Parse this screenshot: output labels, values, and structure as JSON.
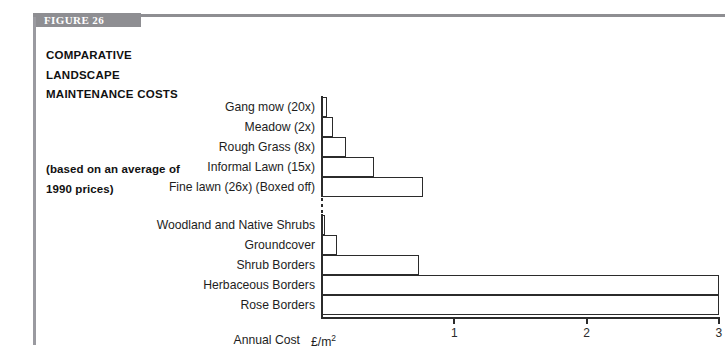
{
  "figure": {
    "tab_label": "FIGURE 26",
    "title": "COMPARATIVE LANDSCAPE MAINTENANCE COSTS",
    "subtitle": "(based on an average of 1990 prices)"
  },
  "axis": {
    "title": "Annual Cost",
    "unit": "£/m",
    "unit_sup": "2"
  },
  "chart_data": {
    "type": "bar",
    "orientation": "horizontal",
    "title": "COMPARATIVE LANDSCAPE MAINTENANCE COSTS",
    "subtitle": "(based on an average of 1990 prices)",
    "xlabel": "Annual Cost £/m2",
    "ylabel": "",
    "xlim": [
      0,
      3.02
    ],
    "xticks": [
      1,
      2,
      3
    ],
    "xticklabels": [
      "1",
      "2",
      "3"
    ],
    "grid": false,
    "legend": false,
    "groups": [
      {
        "name": "Grass regimes",
        "categories": [
          "Gang mow (20x)",
          "Meadow (2x)",
          "Rough Grass (8x)",
          "Informal Lawn (15x)",
          "Fine lawn (26x)  (Boxed off)"
        ],
        "values": [
          0.04,
          0.08,
          0.18,
          0.39,
          0.76
        ]
      },
      {
        "name": "Planted areas",
        "categories": [
          "Woodland and  Native Shrubs",
          "Groundcover",
          "Shrub Borders",
          "Herbaceous Borders",
          "Rose Borders"
        ],
        "values": [
          0.02,
          0.11,
          0.73,
          3.0,
          3.0
        ]
      }
    ]
  }
}
